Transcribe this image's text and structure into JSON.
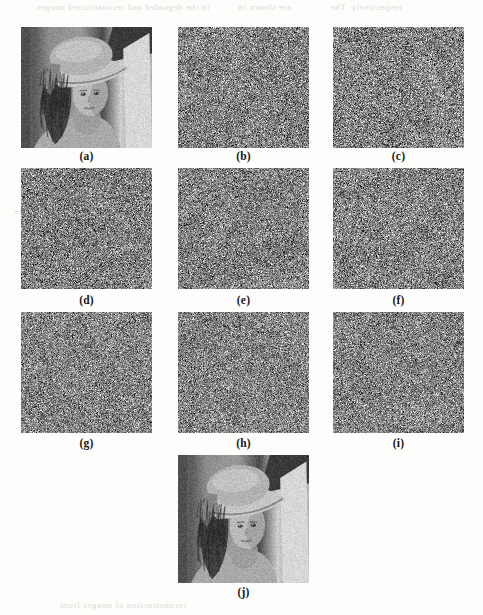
{
  "figure": {
    "kind": "image-grid-figure",
    "page_background": "#fdfdfb",
    "panel_count": 10,
    "grid": {
      "columns": 3,
      "rows": 3,
      "extra_centered_panel": "(j)"
    },
    "caption_style": {
      "color": "#161616",
      "bold": true,
      "size_px": 11.5
    }
  },
  "panels": [
    {
      "id": "a",
      "label": "(a)",
      "content": "lena-grayscale-photo",
      "x": 21,
      "y": 27,
      "w": 131,
      "h": 121,
      "caption_y": 150,
      "type": "image",
      "mean_gray": "#8a8a8a"
    },
    {
      "id": "b",
      "label": "(b)",
      "content": "gray-noise",
      "x": 178,
      "y": 27,
      "w": 131,
      "h": 121,
      "caption_y": 150,
      "type": "noise",
      "mean_gray": "#828282",
      "noise_sigma": 42,
      "seed": 102
    },
    {
      "id": "c",
      "label": "(c)",
      "content": "gray-noise",
      "x": 333,
      "y": 27,
      "w": 131,
      "h": 121,
      "caption_y": 150,
      "type": "noise",
      "mean_gray": "#838383",
      "noise_sigma": 44,
      "seed": 203
    },
    {
      "id": "d",
      "label": "(d)",
      "content": "gray-noise",
      "x": 21,
      "y": 168,
      "w": 131,
      "h": 121,
      "caption_y": 294,
      "type": "noise",
      "mean_gray": "#818181",
      "noise_sigma": 43,
      "seed": 304
    },
    {
      "id": "e",
      "label": "(e)",
      "content": "gray-noise",
      "x": 178,
      "y": 168,
      "w": 131,
      "h": 121,
      "caption_y": 294,
      "type": "noise",
      "mean_gray": "#828282",
      "noise_sigma": 41,
      "seed": 405
    },
    {
      "id": "f",
      "label": "(f)",
      "content": "gray-noise",
      "x": 333,
      "y": 168,
      "w": 131,
      "h": 121,
      "caption_y": 294,
      "type": "noise",
      "mean_gray": "#838383",
      "noise_sigma": 43,
      "seed": 506
    },
    {
      "id": "g",
      "label": "(g)",
      "content": "gray-noise",
      "x": 21,
      "y": 312,
      "w": 131,
      "h": 121,
      "caption_y": 437,
      "type": "noise",
      "mean_gray": "#848484",
      "noise_sigma": 40,
      "seed": 607
    },
    {
      "id": "h",
      "label": "(h)",
      "content": "gray-noise",
      "x": 178,
      "y": 312,
      "w": 131,
      "h": 121,
      "caption_y": 437,
      "type": "noise",
      "mean_gray": "#858585",
      "noise_sigma": 39,
      "seed": 708
    },
    {
      "id": "i",
      "label": "(i)",
      "content": "gray-noise",
      "x": 333,
      "y": 312,
      "w": 131,
      "h": 121,
      "caption_y": 437,
      "type": "noise",
      "mean_gray": "#848484",
      "noise_sigma": 41,
      "seed": 809
    },
    {
      "id": "j",
      "label": "(j)",
      "content": "lena-grayscale-photo",
      "x": 178,
      "y": 455,
      "w": 131,
      "h": 128,
      "caption_y": 586,
      "type": "image",
      "mean_gray": "#8a8a8a"
    }
  ],
  "bleed_through_text": [
    {
      "text": "in the degraded and reconstructed images",
      "x": 36,
      "y": 2
    },
    {
      "text": "are shown in",
      "x": 238,
      "y": 2
    },
    {
      "text": "respectively. The",
      "x": 330,
      "y": 2
    },
    {
      "text": "the the",
      "x": 14,
      "y": 206
    },
    {
      "text": "and noise",
      "x": 404,
      "y": 178
    },
    {
      "text": "reconstruction of images from",
      "x": 60,
      "y": 600
    }
  ]
}
